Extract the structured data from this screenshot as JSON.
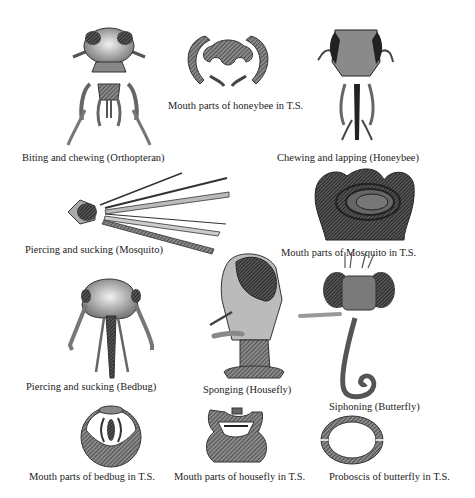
{
  "diagram": {
    "panels": [
      {
        "id": "orthopteran",
        "label": "Biting and chewing (Orthopteran)"
      },
      {
        "id": "honeybee-ts",
        "label": "Mouth parts of honeybee in T.S."
      },
      {
        "id": "honeybee",
        "label": "Chewing and lapping (Honeybee)"
      },
      {
        "id": "mosquito",
        "label": "Piercing and sucking (Mosquito)"
      },
      {
        "id": "mosquito-ts",
        "label": "Mouth parts of Mosquito in T.S."
      },
      {
        "id": "bedbug",
        "label": "Piercing and sucking (Bedbug)"
      },
      {
        "id": "housefly",
        "label": "Sponging (Housefly)"
      },
      {
        "id": "butterfly",
        "label": "Siphoning (Butterfly)"
      },
      {
        "id": "bedbug-ts",
        "label": "Mouth parts of bedbug in T.S."
      },
      {
        "id": "housefly-ts",
        "label": "Mouth parts of housefly in T.S."
      },
      {
        "id": "butterfly-ts",
        "label": "Proboscis of butterfly in T.S."
      }
    ]
  },
  "colors": {
    "ink": "#222222",
    "shade_dark": "#3a3a3a",
    "shade_mid": "#7a7a7a",
    "shade_light": "#b8b8b8",
    "background": "#ffffff"
  }
}
